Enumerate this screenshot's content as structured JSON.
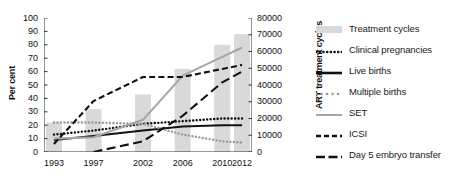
{
  "chart_data": {
    "type": "line",
    "title": "",
    "xlabel": "",
    "ylabel": "Per cent",
    "y2label": "ART treatment cycles",
    "grid": false,
    "legend_position": "right",
    "x": [
      1993,
      1997,
      2002,
      2006,
      2010,
      2012
    ],
    "xtick_labels": [
      "1993",
      "1997",
      "2002",
      "2006",
      "2010",
      "2012"
    ],
    "ylim": [
      0,
      100
    ],
    "ytick_labels": [
      "0",
      "10",
      "20",
      "30",
      "40",
      "50",
      "60",
      "70",
      "80",
      "90",
      "100"
    ],
    "yticks": [
      0,
      10,
      20,
      30,
      40,
      50,
      60,
      70,
      80,
      90,
      100
    ],
    "y2lim": [
      0,
      80000
    ],
    "y2tick_labels": [
      "0",
      "10000",
      "20000",
      "30000",
      "40000",
      "50000",
      "60000",
      "70000",
      "80000"
    ],
    "y2ticks": [
      0,
      10000,
      20000,
      30000,
      40000,
      50000,
      60000,
      70000,
      80000
    ],
    "bars": {
      "name": "Treatment cycles",
      "axis": "right",
      "color": "#d9d9d9",
      "categories": [
        "1993",
        "1997",
        "2002",
        "2006",
        "2010",
        "2012"
      ],
      "values": [
        17600,
        25600,
        34400,
        49600,
        64000,
        70400
      ],
      "values_pct_equivalent": [
        22,
        32,
        43,
        62,
        80,
        88
      ]
    },
    "series": [
      {
        "name": "Clinical pregnancies",
        "style": "dotted",
        "color": "#111111",
        "axis": "left",
        "x": [
          1993,
          1997,
          2002,
          2006,
          2010,
          2012
        ],
        "values": [
          13,
          16,
          21,
          23,
          25,
          25
        ]
      },
      {
        "name": "Live births",
        "style": "solid",
        "color": "#111111",
        "axis": "left",
        "x": [
          1993,
          1997,
          2002,
          2006,
          2010,
          2012
        ],
        "values": [
          9,
          12,
          16,
          19,
          20,
          20
        ]
      },
      {
        "name": "Multiple births",
        "style": "dotted",
        "color": "#9a9a9a",
        "axis": "left",
        "x": [
          1993,
          1997,
          2002,
          2006,
          2010,
          2012
        ],
        "values": [
          22,
          22,
          21,
          13,
          8,
          7
        ]
      },
      {
        "name": "SET",
        "style": "solid",
        "color": "#a6a6a6",
        "axis": "left",
        "x": [
          1993,
          1997,
          2002,
          2006,
          2010,
          2012
        ],
        "values": [
          10,
          11,
          24,
          57,
          71,
          78
        ]
      },
      {
        "name": "ICSI",
        "style": "dashed",
        "color": "#111111",
        "axis": "left",
        "x": [
          1993,
          1997,
          2002,
          2006,
          2010,
          2012
        ],
        "values": [
          6,
          38,
          56,
          56,
          62,
          65
        ]
      },
      {
        "name": "Day 5 embryo transfer",
        "style": "long-dash",
        "color": "#111111",
        "axis": "left",
        "x": [
          1997,
          2002,
          2006,
          2010,
          2012
        ],
        "values": [
          0,
          8,
          27,
          52,
          60
        ]
      }
    ]
  },
  "legend": {
    "items": [
      {
        "label": "Treatment cycles",
        "swatch": "bar-swatch",
        "color": "#d9d9d9"
      },
      {
        "label": "Clinical pregnancies",
        "swatch": "dotted-swatch",
        "color": "#111111"
      },
      {
        "label": "Live births",
        "swatch": "solid-swatch",
        "color": "#111111"
      },
      {
        "label": "Multiple births",
        "swatch": "gray-dot-swatch",
        "color": "#9a9a9a"
      },
      {
        "label": "SET",
        "swatch": "gray-line-swatch",
        "color": "#a6a6a6"
      },
      {
        "label": "ICSI",
        "swatch": "dashed-swatch",
        "color": "#111111"
      },
      {
        "label": "Day 5 embryo transfer",
        "swatch": "longdash-swatch",
        "color": "#111111"
      }
    ]
  }
}
